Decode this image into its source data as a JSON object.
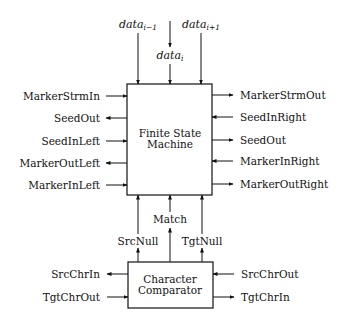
{
  "diagram": {
    "fsm": {
      "label_line1": "Finite State",
      "label_line2": "Machine",
      "inputs_top": [
        {
          "base": "data",
          "sub": "i−1"
        },
        {
          "base": "data",
          "sub": "i"
        },
        {
          "base": "data",
          "sub": "i+1"
        }
      ],
      "left_ports": [
        {
          "label": "MarkerStrmIn",
          "direction": "in"
        },
        {
          "label": "SeedOut",
          "direction": "out"
        },
        {
          "label": "SeedInLeft",
          "direction": "in"
        },
        {
          "label": "MarkerOutLeft",
          "direction": "out"
        },
        {
          "label": "MarkerInLeft",
          "direction": "in"
        }
      ],
      "right_ports": [
        {
          "label": "MarkerStrmOut",
          "direction": "out"
        },
        {
          "label": "SeedInRight",
          "direction": "in"
        },
        {
          "label": "SeedOut",
          "direction": "out"
        },
        {
          "label": "MarkerInRight",
          "direction": "in"
        },
        {
          "label": "MarkerOutRight",
          "direction": "out"
        }
      ]
    },
    "connections": {
      "src_null": "SrcNull",
      "match": "Match",
      "tgt_null": "TgtNull"
    },
    "comparator": {
      "label_line1": "Character",
      "label_line2": "Comparator",
      "left_ports": [
        {
          "label": "SrcChrIn",
          "direction": "out"
        },
        {
          "label": "TgtChrOut",
          "direction": "in"
        }
      ],
      "right_ports": [
        {
          "label": "SrcChrOut",
          "direction": "in"
        },
        {
          "label": "TgtChrIn",
          "direction": "out"
        }
      ]
    }
  }
}
